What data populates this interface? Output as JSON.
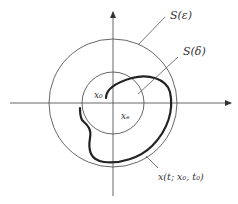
{
  "diagram": {
    "type": "stability-phase-portrait",
    "colors": {
      "line": "#555555",
      "trajectory": "#222222",
      "text": "#333333",
      "background": "#ffffff"
    },
    "labels": {
      "outer_circle": "S(ε)",
      "inner_circle": "S(δ)",
      "start_point": "x₀",
      "origin_point": "xₑ",
      "trajectory": "x(t; x₀, t₀)"
    }
  }
}
